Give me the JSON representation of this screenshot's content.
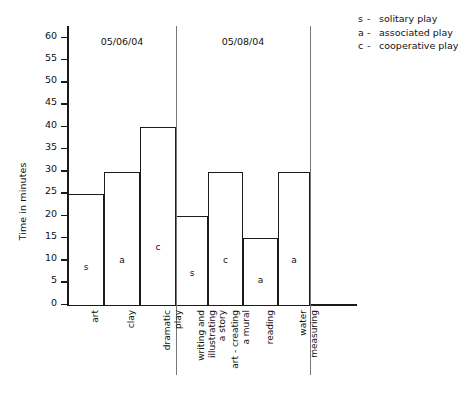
{
  "chart_data": {
    "type": "bar",
    "title": "",
    "xlabel": "",
    "ylabel": "Time in minutes",
    "ylim": [
      0,
      60
    ],
    "ytick_step": 5,
    "yticks": [
      60,
      55,
      50,
      45,
      40,
      35,
      30,
      25,
      20,
      15,
      10,
      5,
      0
    ],
    "grid": false,
    "legend_position": "top-right",
    "categories": [
      "art",
      "clay",
      "dramatic play",
      "writing and illustrating a story",
      "art - creating a mural",
      "reading",
      "water measuring"
    ],
    "values": [
      25,
      30,
      40,
      20,
      30,
      15,
      30
    ],
    "point_codes": [
      "s",
      "a",
      "c",
      "s",
      "c",
      "a",
      "a"
    ],
    "groups": [
      {
        "label": "05/06/04",
        "categories": [
          "art",
          "clay",
          "dramatic play"
        ]
      },
      {
        "label": "05/08/04",
        "categories": [
          "writing and illustrating a story",
          "art - creating a mural",
          "reading",
          "water measuring"
        ]
      }
    ],
    "bars": [
      {
        "category": "art",
        "value": 25,
        "code": "s",
        "group": "05/06/04"
      },
      {
        "category": "clay",
        "value": 30,
        "code": "a",
        "group": "05/06/04"
      },
      {
        "category": "dramatic play",
        "value": 40,
        "code": "c",
        "group": "05/06/04"
      },
      {
        "category": "writing and illustrating a story",
        "value": 20,
        "code": "s",
        "group": "05/08/04"
      },
      {
        "category": "art - creating a mural",
        "value": 30,
        "code": "c",
        "group": "05/08/04"
      },
      {
        "category": "reading",
        "value": 15,
        "code": "a",
        "group": "05/08/04"
      },
      {
        "category": "water measuring",
        "value": 30,
        "code": "a",
        "group": "05/08/04"
      }
    ],
    "legend": [
      {
        "key": "s",
        "dash": "-",
        "label": "solitary play"
      },
      {
        "key": "a",
        "dash": "-",
        "label": "associated play"
      },
      {
        "key": "c",
        "dash": "-",
        "label": "cooperative play"
      }
    ]
  },
  "category_label_lines": [
    [
      "art"
    ],
    [
      "clay"
    ],
    [
      "dramatic",
      "play"
    ],
    [
      "writing and",
      "illustrating",
      "a story"
    ],
    [
      "art - creating",
      "a mural"
    ],
    [
      "reading"
    ],
    [
      "water",
      "measuring"
    ]
  ],
  "colors": {
    "axis": "#1a1a1a",
    "bar_fill": "#ffffff",
    "bar_stroke": "#1a1a1a",
    "separator": "#767676",
    "text": "#111111",
    "background": "#ffffff"
  }
}
